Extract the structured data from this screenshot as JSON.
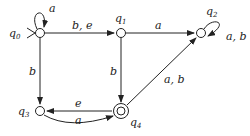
{
  "diagram": {
    "type": "finite-automaton",
    "states": [
      {
        "id": "q0",
        "name": "q",
        "sub": "0",
        "x": 40,
        "y": 33,
        "initial": true,
        "accepting": false
      },
      {
        "id": "q1",
        "name": "q",
        "sub": "1",
        "x": 121,
        "y": 33,
        "initial": false,
        "accepting": false
      },
      {
        "id": "q2",
        "name": "q",
        "sub": "2",
        "x": 201,
        "y": 33,
        "initial": false,
        "accepting": false
      },
      {
        "id": "q3",
        "name": "q",
        "sub": "3",
        "x": 40,
        "y": 111,
        "initial": false,
        "accepting": false
      },
      {
        "id": "q4",
        "name": "q",
        "sub": "4",
        "x": 121,
        "y": 111,
        "initial": false,
        "accepting": true
      }
    ],
    "transitions": [
      {
        "from": "q0",
        "to": "q0",
        "label": "a"
      },
      {
        "from": "q0",
        "to": "q1",
        "label": "b, e"
      },
      {
        "from": "q1",
        "to": "q2",
        "label": "a"
      },
      {
        "from": "q2",
        "to": "q2",
        "label": "a, b"
      },
      {
        "from": "q0",
        "to": "q3",
        "label": "b"
      },
      {
        "from": "q1",
        "to": "q4",
        "label": "b"
      },
      {
        "from": "q4",
        "to": "q2",
        "label": "a, b"
      },
      {
        "from": "q4",
        "to": "q3",
        "label": "e"
      },
      {
        "from": "q3",
        "to": "q4",
        "label": "a"
      }
    ]
  }
}
